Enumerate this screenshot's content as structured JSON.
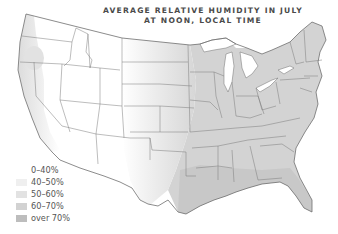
{
  "title": {
    "line1": "AVERAGE RELATIVE HUMIDITY IN JULY",
    "line2": "AT NOON, LOCAL TIME"
  },
  "legend": {
    "items": [
      {
        "label": "0–40%",
        "color": "#ffffff"
      },
      {
        "label": "40–50%",
        "color": "#efefef"
      },
      {
        "label": "50–60%",
        "color": "#e2e2e2"
      },
      {
        "label": "60–70%",
        "color": "#d2d2d2"
      },
      {
        "label": "over 70%",
        "color": "#bdbdbd"
      }
    ]
  },
  "colors": {
    "border": "#6e6e6e",
    "text": "#4a4a4a",
    "dry": "#ffffff",
    "moderate": "#e6e6e6",
    "humid": "#d0d0d0"
  },
  "map": {
    "region": "Contiguous United States",
    "zones": [
      {
        "area": "Interior West (Great Basin, Rockies, Southwest)",
        "range": "0–40%"
      },
      {
        "area": "Pacific coast strip",
        "range": "50–60%"
      },
      {
        "area": "Great Plains",
        "range": "40–50%"
      },
      {
        "area": "Upper Midwest / Corn Belt",
        "range": "50–60%"
      },
      {
        "area": "East and Southeast",
        "range": "60–70%"
      },
      {
        "area": "Gulf coast / Florida",
        "range": "over 70%"
      }
    ]
  }
}
